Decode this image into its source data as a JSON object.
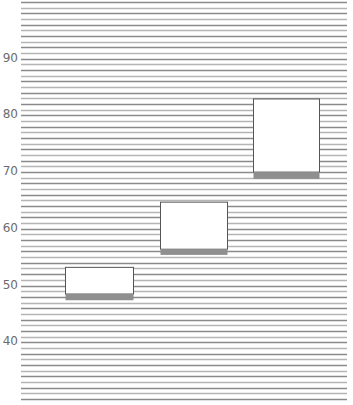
{
  "chart_data": {
    "type": "box",
    "title": "",
    "xlabel": "",
    "ylabel": "",
    "ylim": [
      30,
      100
    ],
    "grid": true,
    "grid_step": 1,
    "yticks": [
      40,
      50,
      60,
      70,
      80,
      90
    ],
    "ytick_labels": [
      "40",
      "50",
      "60",
      "70",
      "80",
      "90"
    ],
    "series": [
      {
        "name": "box-1",
        "upper": 53.2,
        "lower": 48.5,
        "band_bottom": 47.4
      },
      {
        "name": "box-2",
        "upper": 64.7,
        "lower": 56.4,
        "band_bottom": 55.4
      },
      {
        "name": "box-3",
        "upper": 82.9,
        "lower": 70.0,
        "band_bottom": 68.8
      }
    ]
  },
  "colors": {
    "grid_dark": "#8a8a8a",
    "grid_light": "#b5b5b5",
    "box_fill": "#ffffff",
    "box_border": "#555555",
    "band": "#8f8f8f",
    "label": "#6b6b6b"
  }
}
